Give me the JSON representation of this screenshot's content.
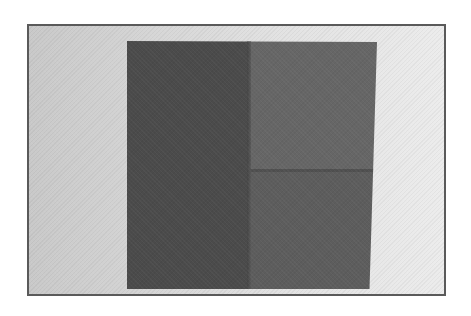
{
  "image": {
    "type": "photograph",
    "colors": {
      "frame_border": "#5a5a5a",
      "background_left": "#c9c9c9",
      "background_right": "#ececec",
      "paper_left_half": "#4b4b4b",
      "paper_top_right_quarter": "#666666",
      "paper_bottom_right_quarter": "#5d5d5d"
    },
    "subject": {
      "name": "folded-dark-paper",
      "folds": [
        "vertical-center",
        "horizontal-right-half"
      ]
    }
  }
}
